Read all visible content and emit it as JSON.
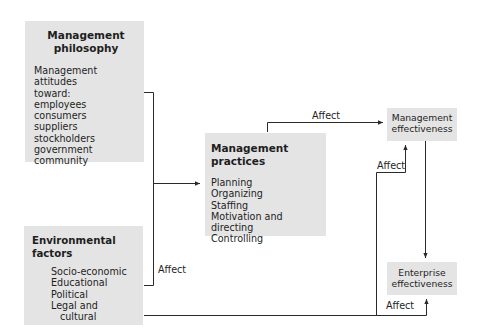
{
  "diagram": {
    "type": "flowchart",
    "nodes": {
      "philosophy": {
        "title": "Management philosophy",
        "title_lines": [
          "Management",
          "philosophy"
        ],
        "intro_lines": [
          "Management attitudes",
          "toward:"
        ],
        "items": [
          "employees",
          "consumers",
          "suppliers",
          "stockholders",
          "government",
          "community"
        ]
      },
      "environment": {
        "title": "Environmental factors",
        "items": [
          "Socio-economic",
          "Educational",
          "Political",
          "Legal and"
        ],
        "item_continuation": "cultural"
      },
      "practices": {
        "title": "Management practices",
        "items": [
          "Planning",
          "Organizing",
          "Staffing",
          "Motivation and directing",
          "Controlling"
        ]
      },
      "management_effectiveness": {
        "title_lines": [
          "Management",
          "effectiveness"
        ]
      },
      "enterprise_effectiveness": {
        "title_lines": [
          "Enterprise",
          "effectiveness"
        ]
      }
    },
    "edges": [
      {
        "from": "philosophy",
        "to": "practices",
        "label": ""
      },
      {
        "from": "environment",
        "to": "practices",
        "label": "Affect"
      },
      {
        "from": "practices",
        "to": "management_effectiveness",
        "label": "Affect"
      },
      {
        "from": "environment",
        "to": "management_effectiveness",
        "label": "Affect"
      },
      {
        "from": "management_effectiveness",
        "to": "enterprise_effectiveness",
        "label": ""
      },
      {
        "from": "environment",
        "to": "enterprise_effectiveness",
        "label": "Affect"
      }
    ],
    "edge_labels": {
      "env_to_practices": "Affect",
      "practices_to_mgmt": "Affect",
      "env_to_mgmt": "Affect",
      "env_to_enterprise": "Affect"
    },
    "colors": {
      "box_fill": "#e4e4e4",
      "line": "#2a2a2a",
      "text": "#1e1e1e"
    }
  }
}
